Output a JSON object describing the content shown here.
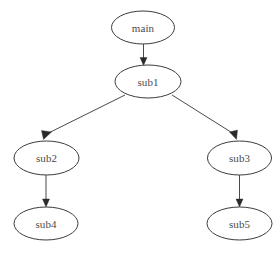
{
  "diagram": {
    "type": "directed-graph",
    "background_color": "#ffffff",
    "node_fill": "#ffffff",
    "node_stroke": "#3b3b3b",
    "edge_color": "#4a4a4a",
    "arrow_color": "#2b2b2b",
    "label_color": "#4a4a4a",
    "nodes": [
      {
        "id": "main",
        "label": "main",
        "cx": 143,
        "cy": 27.5,
        "rx": 31.5,
        "ry": 16.5
      },
      {
        "id": "sub1",
        "label": "sub1",
        "cx": 148,
        "cy": 81.5,
        "rx": 33.0,
        "ry": 16.5
      },
      {
        "id": "sub2",
        "label": "sub2",
        "cx": 46.5,
        "cy": 158,
        "rx": 32.5,
        "ry": 17.0
      },
      {
        "id": "sub3",
        "label": "sub3",
        "cx": 239.5,
        "cy": 158,
        "rx": 32.0,
        "ry": 17.0
      },
      {
        "id": "sub4",
        "label": "sub4",
        "cx": 46.0,
        "cy": 223.5,
        "rx": 32.0,
        "ry": 16.5
      },
      {
        "id": "sub5",
        "label": "sub5",
        "cx": 239.5,
        "cy": 223.5,
        "rx": 32.5,
        "ry": 16.5
      }
    ],
    "edges": [
      {
        "id": "main-sub1",
        "from": "main",
        "to": "sub1",
        "label": "",
        "path": "M 143.5 44 L 143.5 59.5",
        "arrow": "143.5,65.5 140,57.5 147,57.5"
      },
      {
        "id": "sub1-sub2",
        "from": "sub1",
        "to": "sub2",
        "label": "",
        "path": "M 125 95 L 46.5 134",
        "arrow": "43.5,139.5 41.5,130.5 51.5,132"
      },
      {
        "id": "sub1-sub3",
        "from": "sub1",
        "to": "sub3",
        "label": "",
        "path": "M 172 95 L 234 134",
        "arrow": "236.5,139.5 229.5,132 237.5,130"
      },
      {
        "id": "sub2-sub4",
        "from": "sub2",
        "to": "sub4",
        "label": "",
        "path": "M 46 175 L 46 201",
        "arrow": "46,207 42.5,199 49.5,199"
      },
      {
        "id": "sub3-sub5",
        "from": "sub3",
        "to": "sub5",
        "label": "",
        "path": "M 239.5 175 L 239.5 201",
        "arrow": "239.5,207 236,199 243,199"
      }
    ]
  }
}
